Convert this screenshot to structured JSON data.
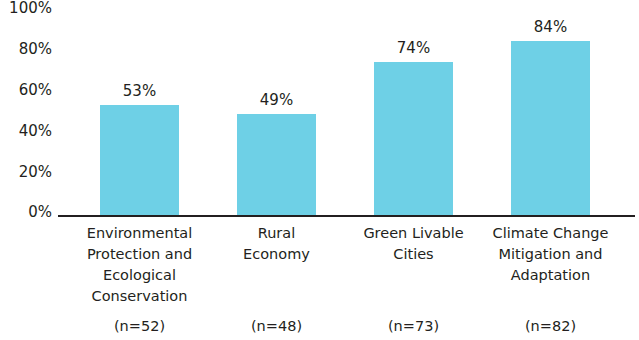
{
  "chart_data": {
    "type": "bar",
    "title": "",
    "xlabel": "",
    "ylabel": "",
    "ylim": [
      0,
      100
    ],
    "grid": false,
    "legend": "none",
    "bar_color": "#6ed0e6",
    "axis_color": "#231f20",
    "y_ticks": [
      "0%",
      "20%",
      "40%",
      "60%",
      "80%",
      "100%"
    ],
    "y_tick_values": [
      0,
      20,
      40,
      60,
      80,
      100
    ],
    "categories": [
      "Environmental Protection and Ecological Conservation",
      "Rural Economy",
      "Green Livable Cities",
      "Climate Change Mitigation and Adaptation"
    ],
    "category_lines": [
      [
        "Environmental",
        "Protection and",
        "Ecological",
        "Conservation"
      ],
      [
        "Rural",
        "Economy"
      ],
      [
        "Green Livable",
        "Cities"
      ],
      [
        "Climate Change",
        "Mitigation and",
        "Adaptation"
      ]
    ],
    "sample_labels": [
      "(n=52)",
      "(n=48)",
      "(n=73)",
      "(n=82)"
    ],
    "values": [
      53,
      49,
      74,
      84
    ],
    "data_labels": [
      "53%",
      "49%",
      "74%",
      "84%"
    ]
  }
}
